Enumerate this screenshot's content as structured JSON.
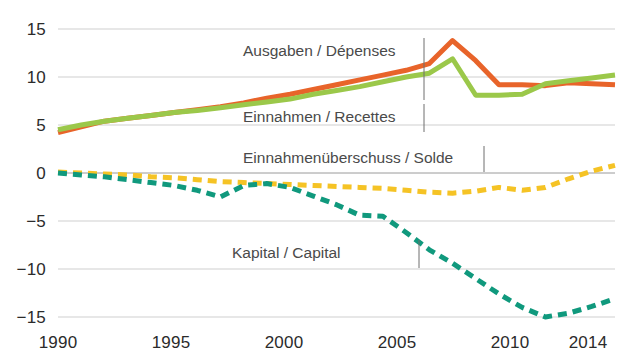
{
  "chart_data": {
    "type": "line",
    "title": "",
    "xlabel": "",
    "ylabel": "",
    "xlim": [
      1990,
      2014
    ],
    "ylim": [
      -15,
      15
    ],
    "ytick_labels": [
      "15",
      "10",
      "5",
      "0",
      "−5",
      "−10",
      "−15"
    ],
    "ytick_values": [
      15,
      10,
      5,
      0,
      -5,
      -10,
      -15
    ],
    "xtick_labels": [
      "1990",
      "1995",
      "2000",
      "2005",
      "2010",
      "2014"
    ],
    "xtick_values": [
      1990,
      1995,
      2000,
      2005,
      2010,
      2014
    ],
    "grid": "horizontal",
    "legend": "inline-annotations",
    "x": [
      1990,
      1991,
      1992,
      1993,
      1994,
      1995,
      1996,
      1997,
      1998,
      1999,
      2000,
      2001,
      2002,
      2003,
      2004,
      2005,
      2006,
      2007,
      2008,
      2009,
      2010,
      2011,
      2012,
      2013,
      2014
    ],
    "series": [
      {
        "name": "Ausgaben / Dépenses",
        "color": "#E8642A",
        "style": "solid",
        "values": [
          4.2,
          4.8,
          5.4,
          5.7,
          6.0,
          6.3,
          6.6,
          6.9,
          7.3,
          7.8,
          8.2,
          8.7,
          9.2,
          9.7,
          10.2,
          10.7,
          11.4,
          13.8,
          11.7,
          9.2,
          9.2,
          9.1,
          9.4,
          9.3,
          9.2
        ]
      },
      {
        "name": "Einnahmen / Recettes",
        "color": "#9BC84A",
        "style": "solid",
        "values": [
          4.5,
          5.0,
          5.4,
          5.7,
          6.0,
          6.3,
          6.5,
          6.8,
          7.1,
          7.4,
          7.7,
          8.2,
          8.6,
          9.0,
          9.5,
          10.0,
          10.4,
          11.9,
          8.1,
          8.1,
          8.2,
          9.3,
          9.6,
          9.9,
          10.2
        ]
      },
      {
        "name": "Einnahmenüberschuss / Solde",
        "color": "#F5C325",
        "style": "dashed",
        "values": [
          0.1,
          0.0,
          -0.1,
          -0.2,
          -0.4,
          -0.5,
          -0.7,
          -0.9,
          -1.0,
          -1.1,
          -1.2,
          -1.3,
          -1.4,
          -1.5,
          -1.6,
          -1.8,
          -2.0,
          -2.1,
          -1.9,
          -1.5,
          -1.8,
          -1.5,
          -0.6,
          0.2,
          0.8
        ]
      },
      {
        "name": "Kapital / Capital",
        "color": "#10997D",
        "style": "dashed",
        "values": [
          0.0,
          -0.2,
          -0.4,
          -0.7,
          -1.0,
          -1.3,
          -1.8,
          -2.5,
          -1.3,
          -1.1,
          -1.5,
          -2.4,
          -3.3,
          -4.4,
          -4.5,
          -6.2,
          -8.0,
          -9.4,
          -11.0,
          -12.6,
          -14.0,
          -15.0,
          -14.6,
          -13.9,
          -13.1
        ]
      }
    ],
    "annotations": [
      {
        "text": "Ausgaben / Dépenses",
        "leader": true
      },
      {
        "text": "Einnahmen / Recettes",
        "leader": true
      },
      {
        "text": "Einnahmenüberschuss / Solde",
        "leader": true
      },
      {
        "text": "Kapital / Capital",
        "leader": true
      }
    ]
  }
}
